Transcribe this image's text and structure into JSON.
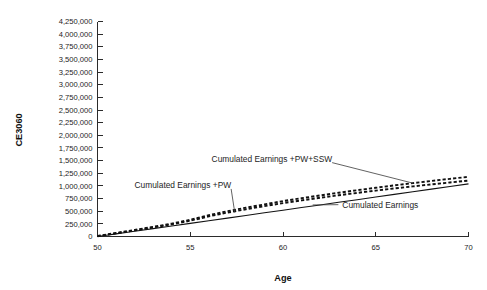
{
  "chart_data": {
    "type": "line",
    "title": "",
    "xlabel": "Age",
    "ylabel": "CE3060",
    "xlim": [
      50,
      70
    ],
    "ylim": [
      0,
      4250000
    ],
    "grid": false,
    "legend_position": "inline-annotations",
    "x": [
      50,
      51,
      52,
      53,
      54,
      55,
      56,
      57,
      58,
      59,
      60,
      61,
      62,
      63,
      64,
      65,
      66,
      67,
      68,
      69,
      70
    ],
    "x_tick_labels": [
      "50",
      "55",
      "60",
      "65",
      "70"
    ],
    "x_tick_values": [
      50,
      55,
      60,
      65,
      70
    ],
    "y_tick_labels": [
      "4,250,000",
      "4,000,000",
      "3,750,000",
      "3,500,000",
      "3,250,000",
      "3,000,000",
      "2,750,000",
      "2,500,000",
      "2,250,000",
      "2,000,000",
      "1,750,000",
      "1,500,000",
      "1,250,000",
      "1,000,000",
      "750,000",
      "500,000",
      "250,000",
      "0"
    ],
    "y_tick_values": [
      4250000,
      4000000,
      3750000,
      3500000,
      3250000,
      3000000,
      2750000,
      2500000,
      2250000,
      2000000,
      1750000,
      1500000,
      1250000,
      1000000,
      750000,
      500000,
      250000,
      0
    ],
    "series": [
      {
        "name": "Cumulated Earnings +PW+SSW",
        "style": "dashed",
        "label_x": 59.4,
        "label_y": 1480000,
        "values": [
          10000,
          70000,
          130000,
          190000,
          255000,
          330000,
          420000,
          500000,
          570000,
          635000,
          700000,
          757000,
          812000,
          865000,
          915000,
          963000,
          1010000,
          1055000,
          1098000,
          1140000,
          1180000
        ]
      },
      {
        "name": "Cumulated Earnings +PW",
        "style": "dashed",
        "label_x": 54.6,
        "label_y": 960000,
        "values": [
          5000,
          62000,
          120000,
          178000,
          240000,
          312000,
          398000,
          472000,
          538000,
          600000,
          660000,
          714000,
          766000,
          815000,
          862000,
          907000,
          950000,
          991000,
          1030000,
          1068000,
          1105000
        ]
      },
      {
        "name": "Cumulated Earnings",
        "style": "solid",
        "label_x": 63.2,
        "label_y": 570000,
        "values": [
          0,
          52000,
          104000,
          156000,
          208000,
          260000,
          312000,
          364000,
          416000,
          468000,
          520000,
          572000,
          624000,
          676000,
          728000,
          780000,
          832000,
          884000,
          936000,
          988000,
          1040000
        ]
      }
    ]
  },
  "axes": {
    "y_title": "CE3060",
    "x_title": "Age"
  }
}
